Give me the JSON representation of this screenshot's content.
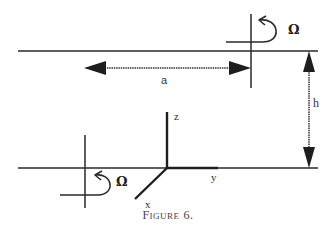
{
  "figure": {
    "caption_big": "F",
    "caption_small": "IGURE",
    "caption_num": "6.",
    "labels": {
      "omega_top": "Ω",
      "omega_bottom": "Ω",
      "distance_a": "a",
      "height_h": "h",
      "axis_z": "z",
      "axis_y": "y",
      "axis_x": "x"
    },
    "colors": {
      "line": "#2a2a2a",
      "background": "#ffffff"
    }
  }
}
